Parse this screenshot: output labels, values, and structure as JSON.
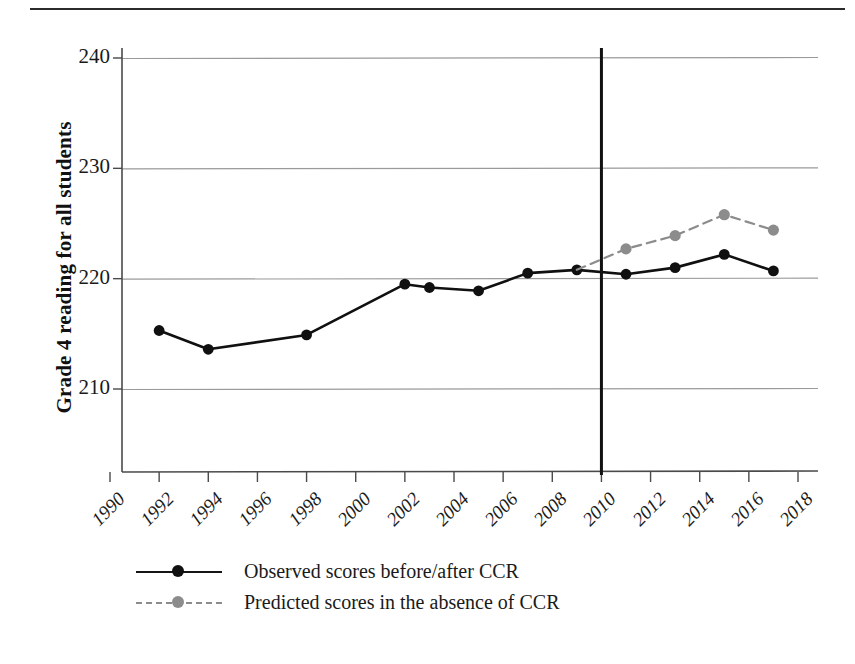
{
  "figure": {
    "y_axis_title": "Grade 4 reading for all students",
    "top_rule": "horizontal-rule"
  },
  "legend": {
    "items": [
      {
        "label": "Observed scores before/after CCR",
        "color": "#101010",
        "style": "solid",
        "marker": "filled-circle"
      },
      {
        "label": "Predicted scores in the absence of CCR",
        "color": "#8c8c8c",
        "style": "dashed",
        "marker": "filled-circle"
      }
    ]
  },
  "chart_data": {
    "type": "line",
    "title": "",
    "xlabel": "",
    "ylabel": "Grade 4 reading for all students",
    "xlim": [
      1990,
      2018
    ],
    "ylim": [
      205,
      243
    ],
    "yticks": [
      210,
      220,
      230,
      240
    ],
    "ytick_labels": [
      "210",
      "220",
      "230",
      "240"
    ],
    "xticks": [
      1990,
      1992,
      1994,
      1996,
      1998,
      2000,
      2002,
      2004,
      2006,
      2008,
      2010,
      2012,
      2014,
      2016,
      2018
    ],
    "xtick_labels": [
      "1990",
      "1992",
      "1994",
      "1996",
      "1998",
      "2000",
      "2002",
      "2004",
      "2006",
      "2008",
      "2010",
      "2012",
      "2014",
      "2016",
      "2018"
    ],
    "grid": "horizontal",
    "legend_position": "below-left",
    "annotations": [
      {
        "type": "vertical-line",
        "x": 2010,
        "label": "CCR adoption",
        "color": "#111111"
      }
    ],
    "series": [
      {
        "name": "Observed scores before/after CCR",
        "color": "#101010",
        "style": "solid",
        "marker": "filled-circle",
        "points": [
          {
            "x": 1992,
            "y": 215.3
          },
          {
            "x": 1994,
            "y": 213.6
          },
          {
            "x": 1998,
            "y": 214.9
          },
          {
            "x": 2002,
            "y": 219.5
          },
          {
            "x": 2003,
            "y": 219.2
          },
          {
            "x": 2005,
            "y": 218.9
          },
          {
            "x": 2007,
            "y": 220.5
          },
          {
            "x": 2009,
            "y": 220.8
          },
          {
            "x": 2011,
            "y": 220.4
          },
          {
            "x": 2013,
            "y": 221.0
          },
          {
            "x": 2015,
            "y": 222.2
          },
          {
            "x": 2017,
            "y": 220.7
          }
        ]
      },
      {
        "name": "Predicted scores in the absence of CCR",
        "color": "#8c8c8c",
        "style": "dashed",
        "marker": "filled-circle",
        "points": [
          {
            "x": 2009,
            "y": 220.8
          },
          {
            "x": 2011,
            "y": 222.7
          },
          {
            "x": 2013,
            "y": 223.9
          },
          {
            "x": 2015,
            "y": 225.8
          },
          {
            "x": 2017,
            "y": 224.4
          }
        ]
      }
    ]
  }
}
